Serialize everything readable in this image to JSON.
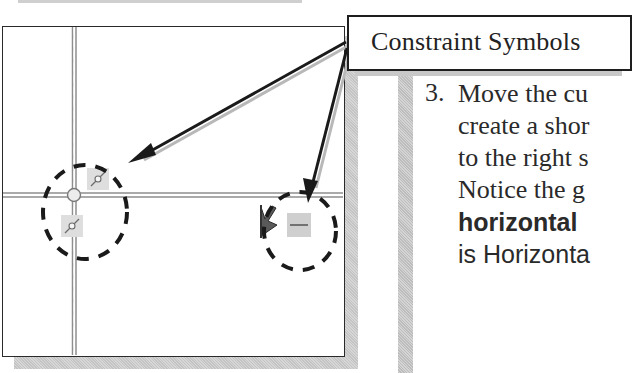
{
  "callout": {
    "label": "Constraint Symbols"
  },
  "instructions": {
    "step_number": "3.",
    "lines": [
      "Move the cu",
      "create a shor",
      "to the right s",
      "Notice the g",
      "horizontal",
      "is Horizonta"
    ]
  },
  "canvas": {
    "constraint_symbols": [
      {
        "name": "coincident-icon-upper",
        "type": "coincident"
      },
      {
        "name": "coincident-icon-lower",
        "type": "coincident"
      },
      {
        "name": "horizontal-constraint-icon",
        "type": "horizontal"
      }
    ],
    "colors": {
      "construction_line": "#9a9a9a",
      "dash_circle": "#1a1a1a",
      "arrow": "#1a1a1a",
      "symbol_bg": "#dcdcdc"
    }
  }
}
